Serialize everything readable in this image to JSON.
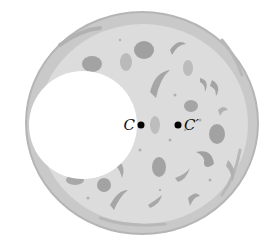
{
  "diagram": {
    "colors": {
      "background": "#ffffff",
      "crust": "#c9c9c9",
      "crust_edge": "#b8b8b8",
      "cheese": "#dcdcdc",
      "topping": "#a3a3a3",
      "topping_light": "#bdbdbd",
      "point": "#000000"
    },
    "pizza": {
      "cx": 142,
      "cy": 123,
      "r": 115,
      "inner_r": 104
    },
    "hole": {
      "cx": 83,
      "cy": 125,
      "r": 54
    },
    "points": [
      {
        "id": "C",
        "label": "C",
        "x": 141,
        "y": 125
      },
      {
        "id": "C-prime",
        "label": "C′",
        "x": 178,
        "y": 125
      }
    ]
  }
}
